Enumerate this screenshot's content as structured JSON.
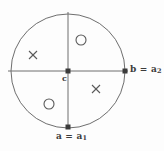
{
  "figure": {
    "kind": "geometric-circle-diagram",
    "background_color": "#fdfdfd",
    "ink_color": "#4a4a4a",
    "label_color": "#3b3b3b",
    "width": 164,
    "height": 151,
    "circle": {
      "center_x": 68,
      "center_y": 71,
      "radius": 57,
      "stroke_color": "#6e6e6e",
      "stroke_width": 1
    },
    "axes": {
      "horizontal": {
        "x1": 8,
        "y1": 71,
        "x2": 128,
        "y2": 71
      },
      "vertical": {
        "x1": 68,
        "y1": 12,
        "x2": 68,
        "y2": 128
      },
      "stroke_color": "#6e6e6e",
      "stroke_width": 1
    },
    "points": [
      {
        "id": "center",
        "name": "c",
        "label": "c",
        "label_plain": "c",
        "x": 68,
        "y": 71,
        "marker": "filled-square",
        "marker_size": 5
      },
      {
        "id": "right",
        "name": "b",
        "label_lead": "b = a",
        "label_sub": "2",
        "label_plain": "b = a2",
        "x": 125,
        "y": 71,
        "marker": "filled-square",
        "marker_size": 5
      },
      {
        "id": "bottom",
        "name": "a",
        "label_lead": "a = a",
        "label_sub": "1",
        "label_plain": "a = a1",
        "x": 68,
        "y": 127,
        "marker": "filled-square",
        "marker_size": 5
      }
    ],
    "markers": [
      {
        "id": "cross-upper-left",
        "glyph": "x",
        "quadrant": "upper-left",
        "x": 33,
        "y": 55
      },
      {
        "id": "cross-lower-right",
        "glyph": "x",
        "quadrant": "lower-right",
        "x": 96,
        "y": 89
      },
      {
        "id": "circle-upper-right",
        "glyph": "o",
        "quadrant": "upper-right",
        "x": 81,
        "y": 40
      },
      {
        "id": "circle-lower-left",
        "glyph": "o",
        "quadrant": "lower-left",
        "x": 49,
        "y": 104
      }
    ]
  }
}
